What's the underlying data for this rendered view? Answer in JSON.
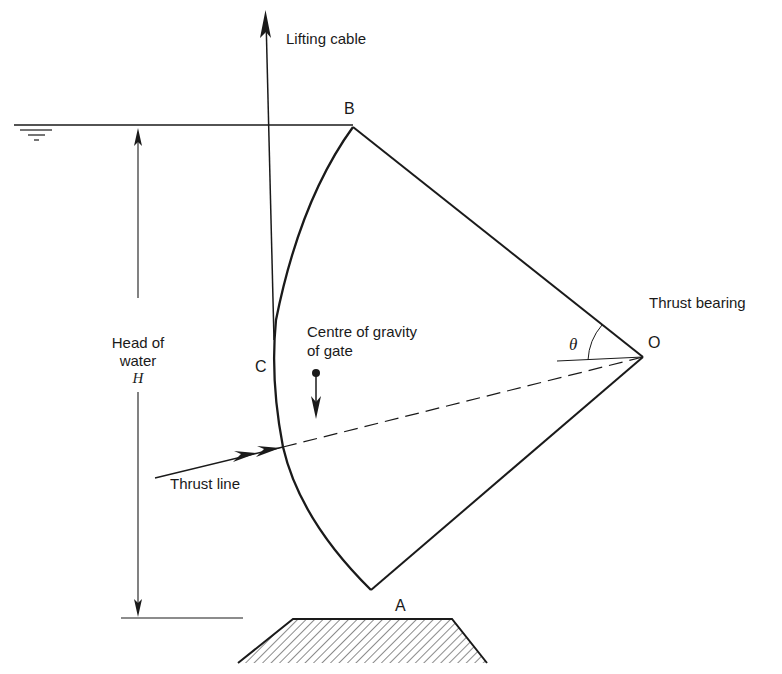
{
  "diagram": {
    "type": "radial (Tainter) gate — forces diagram",
    "points": {
      "A": "A",
      "B": "B",
      "C": "C",
      "O": "O"
    },
    "labels": {
      "lifting_cable": "Lifting cable",
      "thrust_bearing": "Thrust bearing",
      "centre_of_gravity_line1": "Centre of gravity",
      "centre_of_gravity_line2": "of gate",
      "head_line1": "Head of",
      "head_line2": "water",
      "head_symbol": "H",
      "thrust_line": "Thrust line",
      "angle": "θ"
    },
    "colors": {
      "ink": "#1a1a1a",
      "background": "#ffffff"
    }
  }
}
